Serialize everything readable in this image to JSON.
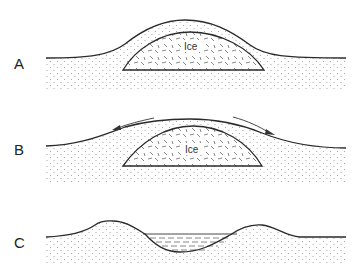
{
  "panels": [
    {
      "id": "A",
      "label": "A",
      "ice_label": "Ice",
      "description": "Ice body buried beneath sediment mound"
    },
    {
      "id": "B",
      "label": "B",
      "ice_label": "Ice",
      "description": "Sediment slumping off ice core, arrows indicate downslope movement"
    },
    {
      "id": "C",
      "label": "C",
      "description": "Ice melted leaving water-filled depression between ridges"
    }
  ],
  "colors": {
    "line": "#2a2a2a",
    "stipple": "#9a9a9a",
    "background": "#ffffff"
  }
}
